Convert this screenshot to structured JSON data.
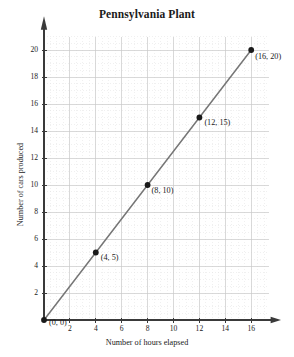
{
  "chart_data": {
    "type": "line",
    "title": "Pennsylvania Plant",
    "xlabel": "Number of hours elapsed",
    "ylabel": "Number of cars produced",
    "x": [
      0,
      4,
      8,
      12,
      16
    ],
    "values": [
      0,
      5,
      10,
      15,
      20
    ],
    "point_labels": [
      "(0, 0)",
      "(4, 5)",
      "(8, 10)",
      "(12, 15)",
      "(16, 20)"
    ],
    "xlim": [
      0,
      17.2
    ],
    "ylim": [
      0,
      21.2
    ],
    "xticks": [
      2,
      4,
      6,
      8,
      10,
      12,
      14,
      16
    ],
    "yticks": [
      2,
      4,
      6,
      8,
      10,
      12,
      14,
      16,
      18,
      20
    ],
    "xtick_labels": [
      "2",
      "4",
      "6",
      "8",
      "10",
      "12",
      "14",
      "16"
    ],
    "ytick_labels": [
      "2",
      "4",
      "6",
      "8",
      "10",
      "12",
      "14",
      "16",
      "18",
      "20"
    ],
    "grid": true,
    "grid_major_step": 2,
    "grid_minor_step": 0.5,
    "legend": null,
    "line_color": "#767676",
    "marker_color": "#1a1a1a",
    "axis_color": "#3a3a3a",
    "grid_major_color": "#c9c9c9",
    "grid_minor_color": "#e2e2e2",
    "background_color": "#ffffff",
    "slope": 1.25,
    "intercept": 0,
    "relationship": "Number of cars produced = 1.25 x Number of hours elapsed"
  }
}
